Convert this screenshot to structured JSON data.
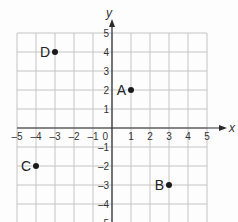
{
  "chart_data": {
    "type": "scatter",
    "title": "",
    "xlabel": "x",
    "ylabel": "y",
    "xlim": [
      -5,
      5
    ],
    "ylim": [
      -5,
      5
    ],
    "grid": true,
    "x_ticks": [
      "-5",
      "-4",
      "-3",
      "-2",
      "-1",
      "0",
      "1",
      "2",
      "3",
      "4",
      "5"
    ],
    "y_ticks": [
      "5",
      "4",
      "3",
      "2",
      "1",
      "-1",
      "-2",
      "-3",
      "-4",
      "-5"
    ],
    "points": [
      {
        "label": "A",
        "x": 1,
        "y": 2
      },
      {
        "label": "B",
        "x": 3,
        "y": -3
      },
      {
        "label": "C",
        "x": -4,
        "y": -2
      },
      {
        "label": "D",
        "x": -3,
        "y": 4
      }
    ]
  },
  "axes": {
    "x_label": "x",
    "y_label": "y"
  },
  "colors": {
    "grid": "#c4c4c4",
    "axis": "#2a2a2a",
    "point": "#1a1a1a",
    "background": "#fdfdfd"
  }
}
